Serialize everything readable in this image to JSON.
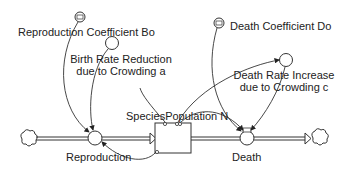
{
  "diagram": {
    "type": "stock-and-flow",
    "stock": {
      "label": "SpeciesPopulation N"
    },
    "flows": [
      {
        "id": "reproduction",
        "label": "Reproduction"
      },
      {
        "id": "death",
        "label": "Death"
      }
    ],
    "constants": [
      {
        "id": "repro-coef",
        "label": "Reproduction Coefficient Bo"
      },
      {
        "id": "death-coef",
        "label": "Death Coefficient Do"
      }
    ],
    "auxiliaries": [
      {
        "id": "birth-reduction",
        "line1": "Birth Rate Reduction",
        "line2": "due to Crowding a"
      },
      {
        "id": "death-increase",
        "line1": "Death Rate Increase",
        "line2": "due to Crowding c"
      }
    ],
    "colors": {
      "line": "#333333",
      "background": "#ffffff"
    }
  }
}
